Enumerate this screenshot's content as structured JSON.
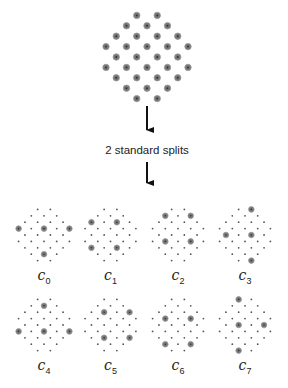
{
  "diagram": {
    "caption": "2 standard splits",
    "colors": {
      "dot": "#555555",
      "circled_dot_fill": "#777777",
      "circled_ring": "#999999",
      "arrow": "#111111",
      "text": "#222222"
    },
    "row_counts": [
      2,
      3,
      4,
      5,
      4,
      5,
      4,
      3,
      2
    ],
    "source_pattern": {
      "center_x": 147,
      "center_y": 57,
      "dx": 20.5,
      "dy": 10.4,
      "all_circled": true
    },
    "arrows": [
      {
        "x": 147,
        "y1": 106,
        "y2": 138
      },
      {
        "x": 147,
        "y1": 162,
        "y2": 191
      }
    ],
    "caption_pos": {
      "x": 147,
      "y": 144
    },
    "subpatterns": [
      {
        "name": "c_0",
        "label_main": "c",
        "label_sub": "0",
        "center_x": 44,
        "center_y": 235,
        "label_y": 267,
        "circled": [
          [
            3,
            0
          ],
          [
            3,
            2
          ],
          [
            3,
            4
          ],
          [
            7,
            1
          ]
        ]
      },
      {
        "name": "c_1",
        "label_main": "c",
        "label_sub": "1",
        "center_x": 110.5,
        "center_y": 235,
        "label_y": 267,
        "circled": [
          [
            2,
            0
          ],
          [
            2,
            2
          ],
          [
            6,
            0
          ],
          [
            6,
            2
          ]
        ]
      },
      {
        "name": "c_2",
        "label_main": "c",
        "label_sub": "2",
        "center_x": 178,
        "center_y": 235,
        "label_y": 267,
        "circled": [
          [
            1,
            0
          ],
          [
            1,
            2
          ],
          [
            5,
            1
          ],
          [
            5,
            3
          ]
        ]
      },
      {
        "name": "c_3",
        "label_main": "c",
        "label_sub": "3",
        "center_x": 245,
        "center_y": 235,
        "label_y": 267,
        "circled": [
          [
            0,
            1
          ],
          [
            4,
            0
          ],
          [
            4,
            2
          ],
          [
            8,
            1
          ]
        ]
      },
      {
        "name": "c_4",
        "label_main": "c",
        "label_sub": "4",
        "center_x": 44,
        "center_y": 325,
        "label_y": 357,
        "circled": [
          [
            1,
            1
          ],
          [
            5,
            0
          ],
          [
            5,
            2
          ],
          [
            5,
            4
          ]
        ]
      },
      {
        "name": "c_5",
        "label_main": "c",
        "label_sub": "5",
        "center_x": 110.5,
        "center_y": 325,
        "label_y": 357,
        "circled": [
          [
            2,
            1
          ],
          [
            2,
            3
          ],
          [
            6,
            1
          ],
          [
            6,
            3
          ]
        ]
      },
      {
        "name": "c_6",
        "label_main": "c",
        "label_sub": "6",
        "center_x": 178,
        "center_y": 325,
        "label_y": 357,
        "circled": [
          [
            3,
            1
          ],
          [
            3,
            3
          ],
          [
            7,
            0
          ],
          [
            7,
            2
          ]
        ]
      },
      {
        "name": "c_7",
        "label_main": "c",
        "label_sub": "7",
        "center_x": 245,
        "center_y": 325,
        "label_y": 357,
        "circled": [
          [
            0,
            0
          ],
          [
            4,
            1
          ],
          [
            4,
            3
          ],
          [
            8,
            0
          ]
        ]
      }
    ],
    "subpattern_dx": 12.7,
    "subpattern_dy": 6.4
  }
}
